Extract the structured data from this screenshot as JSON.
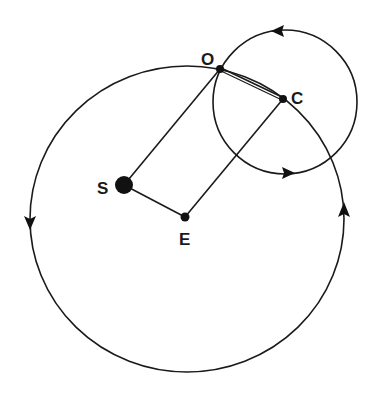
{
  "diagram": {
    "type": "orbital-geometry",
    "colors": {
      "ink": "#1a1a1a",
      "background": "#ffffff"
    },
    "labels": {
      "O": "O",
      "C": "C",
      "S": "S",
      "E": "E"
    },
    "points": {
      "O": {
        "x": 220,
        "y": 69,
        "radius": 4
      },
      "C": {
        "x": 283,
        "y": 99,
        "radius": 4
      },
      "S": {
        "x": 124,
        "y": 185,
        "radius": 9
      },
      "E": {
        "x": 185,
        "y": 217,
        "radius": 4.5
      }
    },
    "circles": {
      "large": {
        "cx": 187,
        "cy": 219,
        "rx": 157,
        "ry": 153,
        "arrows": [
          "down-left",
          "up-right"
        ]
      },
      "small": {
        "cx": 285,
        "cy": 102,
        "r": 72,
        "arrows": [
          "left-top",
          "right-bottom"
        ]
      }
    },
    "segments": [
      {
        "from": "S",
        "to": "O"
      },
      {
        "from": "S",
        "to": "E"
      },
      {
        "from": "E",
        "to": "C"
      },
      {
        "from": "O",
        "to": "C",
        "style": "double"
      }
    ]
  }
}
